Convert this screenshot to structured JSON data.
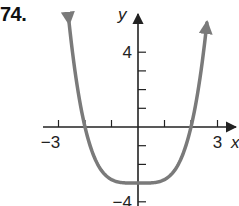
{
  "problem": {
    "number": "74."
  },
  "chart_data": {
    "type": "line",
    "title": "",
    "xlabel": "x",
    "ylabel": "y",
    "xlim": [
      -3.2,
      3.4
    ],
    "ylim": [
      -4,
      5.6
    ],
    "x_ticks": [
      -3,
      -2,
      -1,
      1,
      2,
      3
    ],
    "y_ticks": [
      -4,
      -3,
      -2,
      -1,
      1,
      2,
      3,
      4
    ],
    "x_tick_labels": {
      "-3": "−3",
      "3": "3"
    },
    "y_tick_labels": {
      "4": "4",
      "-4": "−4"
    },
    "grid": false,
    "legend": null,
    "series": [
      {
        "name": "f(x)",
        "description": "Even quartic-like curve, minimum at (0,-3), x-intercepts at -2 and 2, arrows pointing up at both ends",
        "x": [
          -2.6,
          -2.4,
          -2.2,
          -2,
          -1.5,
          -1,
          -0.5,
          0,
          0.5,
          1,
          1.5,
          2,
          2.2,
          2.4,
          2.6
        ],
        "y": [
          5.57,
          3.22,
          1.39,
          0,
          -2.05,
          -2.81,
          -2.99,
          -3,
          -2.99,
          -2.81,
          -2.05,
          0,
          1.39,
          3.22,
          5.57
        ],
        "color": "#7a7a7a"
      }
    ],
    "key_points": {
      "minimum": [
        0,
        -3
      ],
      "x_intercepts": [
        -2,
        2
      ],
      "y_intercept": -3
    }
  },
  "colors": {
    "curve": "#7a7a7a",
    "axis": "#222222"
  }
}
